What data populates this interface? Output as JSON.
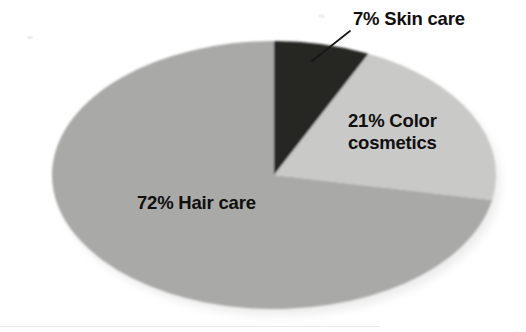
{
  "figure": {
    "kind": "pie-chart",
    "background_color": "#ffffff"
  },
  "labels": {
    "skin_care": "7% Skin care",
    "color_cosmetics_line1": "21% Color",
    "color_cosmetics_line2": "cosmetics",
    "hair_care": "72% Hair care"
  },
  "chart_data": {
    "type": "pie",
    "title": "",
    "subtitle": "",
    "xlabel": "",
    "ylabel": "",
    "grid": false,
    "legend_position": "none",
    "labels_mode": "inline-callout",
    "start_angle_deg": 0,
    "direction": "clockwise",
    "categories": [
      "Skin care",
      "Color cosmetics",
      "Hair care"
    ],
    "values": [
      7,
      21,
      72
    ],
    "value_unit": "%",
    "data_labels": [
      "7% Skin care",
      "21% Color cosmetics",
      "72% Hair care"
    ],
    "colors": [
      "#262523",
      "#c9c9c7",
      "#a9a9a7"
    ],
    "slices": [
      {
        "name": "Skin care",
        "value": 7,
        "label": "7% Skin care",
        "color": "#262523",
        "label_placement": "outside-callout",
        "has_leader_line": true
      },
      {
        "name": "Color cosmetics",
        "value": 21,
        "label": "21% Color cosmetics",
        "color": "#c9c9c7",
        "label_placement": "inside",
        "has_leader_line": false
      },
      {
        "name": "Hair care",
        "value": 72,
        "label": "72% Hair care",
        "color": "#a9a9a7",
        "label_placement": "inside",
        "has_leader_line": false
      }
    ],
    "total": 100
  },
  "geometry": {
    "center_x": 274,
    "center_y": 175,
    "radius_x": 222,
    "radius_y": 134
  },
  "colors": {
    "skin_care": "#262523",
    "color_cosmetics": "#c9c9c7",
    "hair_care": "#a9a9a7",
    "text": "#100f0f",
    "leader_line": "#161616",
    "background": "#ffffff"
  }
}
